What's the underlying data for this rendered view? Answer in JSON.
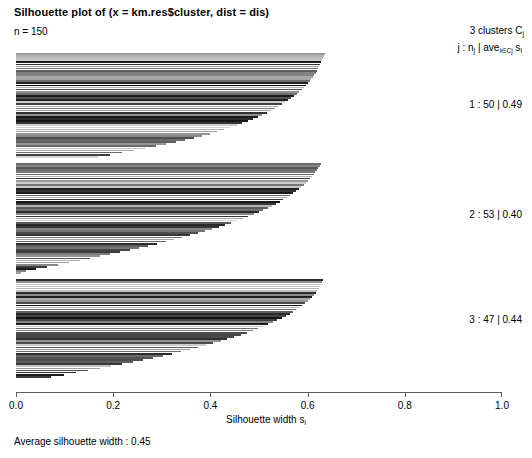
{
  "title": "Silhouette plot of (x = km.res$cluster, dist = dis)",
  "n_label": "n = 150",
  "legend": {
    "line1": "3 clusters  C",
    "line1_sub": "j",
    "line2_a": "j :  n",
    "line2_sub_a": "j",
    "line2_b": " | ave",
    "line2_sub_b": "i∈Cj",
    "line2_c": " s",
    "line2_sub_c": "i"
  },
  "cluster_labels": [
    {
      "text": "1 :   50  |  0.49",
      "top": 99
    },
    {
      "text": "2 :   53  |  0.40",
      "top": 209
    },
    {
      "text": "3 :   47  |  0.44",
      "top": 314
    }
  ],
  "axis": {
    "ticks": [
      "0.0",
      "0.2",
      "0.4",
      "0.6",
      "0.8",
      "1.0"
    ],
    "xlabel_a": "Silhouette width s",
    "xlabel_sub": "i"
  },
  "footer": "Average silhouette width :  0.45",
  "colors": {
    "axis": "#5d5d5d",
    "background": "#ffffff",
    "text": "#000000"
  },
  "chart_data": {
    "type": "bar",
    "orientation": "horizontal",
    "title": "Silhouette plot of (x = km.res$cluster, dist = dis)",
    "subtitle": "n = 150",
    "xlabel": "Silhouette width s_i",
    "ylabel": "",
    "xlim": [
      0.0,
      1.0
    ],
    "grid": false,
    "n_total": 150,
    "average_silhouette_width": 0.45,
    "legend_position": "right",
    "clusters": [
      {
        "id": 1,
        "size": 50,
        "avg_silhouette": 0.49,
        "values": [
          0.636,
          0.634,
          0.632,
          0.63,
          0.628,
          0.626,
          0.624,
          0.622,
          0.62,
          0.617,
          0.614,
          0.611,
          0.608,
          0.604,
          0.6,
          0.596,
          0.592,
          0.588,
          0.583,
          0.578,
          0.572,
          0.566,
          0.56,
          0.554,
          0.547,
          0.54,
          0.532,
          0.524,
          0.516,
          0.507,
          0.498,
          0.488,
          0.477,
          0.466,
          0.454,
          0.441,
          0.428,
          0.414,
          0.399,
          0.383,
          0.366,
          0.348,
          0.329,
          0.309,
          0.288,
          0.266,
          0.243,
          0.219,
          0.194,
          0.168
        ]
      },
      {
        "id": 2,
        "size": 53,
        "avg_silhouette": 0.4,
        "values": [
          0.628,
          0.625,
          0.622,
          0.619,
          0.616,
          0.613,
          0.609,
          0.605,
          0.601,
          0.597,
          0.592,
          0.587,
          0.582,
          0.576,
          0.57,
          0.564,
          0.557,
          0.55,
          0.543,
          0.535,
          0.527,
          0.518,
          0.509,
          0.499,
          0.489,
          0.478,
          0.467,
          0.455,
          0.443,
          0.43,
          0.417,
          0.403,
          0.389,
          0.374,
          0.358,
          0.342,
          0.325,
          0.308,
          0.29,
          0.272,
          0.253,
          0.234,
          0.214,
          0.194,
          0.173,
          0.152,
          0.131,
          0.109,
          0.087,
          0.064,
          0.042,
          0.02,
          0.01
        ]
      },
      {
        "id": 3,
        "size": 47,
        "avg_silhouette": 0.44,
        "values": [
          0.632,
          0.63,
          0.628,
          0.626,
          0.623,
          0.62,
          0.617,
          0.613,
          0.609,
          0.605,
          0.6,
          0.595,
          0.589,
          0.583,
          0.577,
          0.57,
          0.563,
          0.555,
          0.547,
          0.538,
          0.529,
          0.519,
          0.509,
          0.498,
          0.487,
          0.475,
          0.462,
          0.449,
          0.435,
          0.421,
          0.406,
          0.39,
          0.374,
          0.357,
          0.339,
          0.321,
          0.302,
          0.282,
          0.262,
          0.241,
          0.219,
          0.196,
          0.173,
          0.149,
          0.124,
          0.099,
          0.073
        ]
      }
    ]
  }
}
